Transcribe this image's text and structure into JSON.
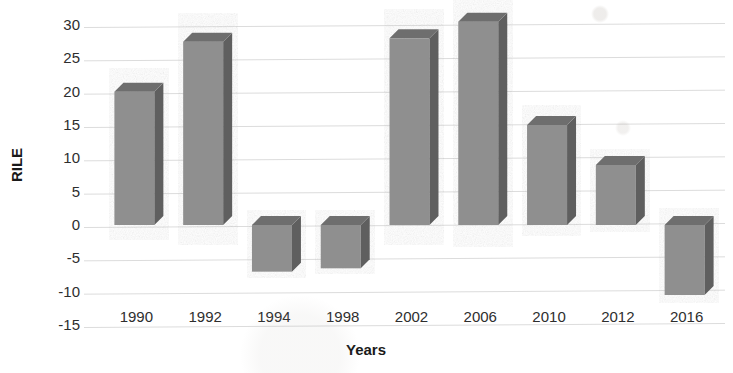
{
  "chart_data": {
    "type": "bar",
    "title": "",
    "xlabel": "Years",
    "ylabel": "RILE",
    "categories": [
      "1990",
      "1992",
      "1994",
      "1998",
      "2002",
      "2006",
      "2010",
      "2012",
      "2016"
    ],
    "values": [
      20,
      27.5,
      -7,
      -6.5,
      28,
      30.5,
      15,
      9,
      -10.5
    ],
    "ylim": [
      -15,
      30
    ],
    "ytick_labels": [
      "30",
      "25",
      "20",
      "15",
      "10",
      "5",
      "0",
      "-5",
      "-10",
      "-15"
    ],
    "ytick_values": [
      30,
      25,
      20,
      15,
      10,
      5,
      0,
      -5,
      -10,
      -15
    ],
    "grid": true,
    "legend": "none",
    "style": "3d-bar",
    "bar_color": "#8f8f8f",
    "bar_top_color": "#6e6e6e",
    "bar_side_color": "#5f5f5f",
    "gridline_color": "#dcdcdc",
    "text_color": "#2e2e2e"
  }
}
